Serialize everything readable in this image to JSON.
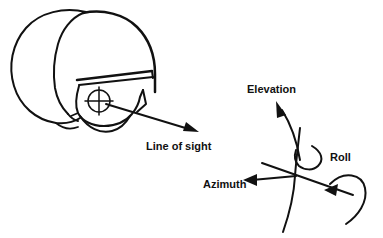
{
  "figure": {
    "background_color": "#ffffff",
    "ink_color": "#111111",
    "width": 383,
    "height": 238
  },
  "left_panel": {
    "name": "helmeted-head-profile",
    "description": "Side profile of a head wearing a flight helmet with visor, oxygen mask and a reticle crosshair over the eye position",
    "parts": [
      {
        "id": "head-outline",
        "label": "head"
      },
      {
        "id": "helmet-shell",
        "label": "helmet"
      },
      {
        "id": "visor-bar",
        "label": "visor"
      },
      {
        "id": "oxygen-mask",
        "label": "mask"
      },
      {
        "id": "reticle",
        "label": "reticle"
      }
    ]
  },
  "right_panel": {
    "name": "angular-axes",
    "description": "Three rotational degrees of freedom emanating from a common origin"
  },
  "labels": {
    "line_of_sight": "Line of sight",
    "elevation": "Elevation",
    "azimuth": "Azimuth",
    "roll": "Roll"
  },
  "arrows": [
    {
      "name": "line-of-sight-arrow",
      "label_key": "line_of_sight",
      "direction": "down-right",
      "from": "reticle"
    },
    {
      "name": "elevation-arrow",
      "label_key": "elevation",
      "direction": "up-left",
      "style": "curved"
    },
    {
      "name": "azimuth-arrow",
      "label_key": "azimuth",
      "direction": "left",
      "style": "straight"
    },
    {
      "name": "roll-arrow",
      "label_key": "roll",
      "direction": "counter-clockwise-loop",
      "style": "curved-loop"
    }
  ]
}
